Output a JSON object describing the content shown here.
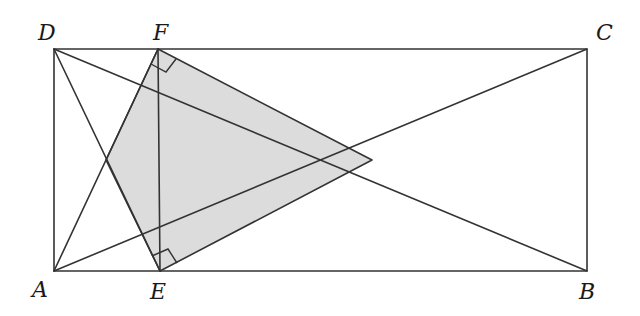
{
  "figure": {
    "colors": {
      "line": "#333333",
      "shade": "#dcdcdc",
      "label": "#1a1a1a",
      "background": "#ffffff"
    },
    "points": {
      "A": {
        "label": "A",
        "x": 54,
        "y": 271
      },
      "B": {
        "label": "B",
        "x": 587,
        "y": 271
      },
      "C": {
        "label": "C",
        "x": 587,
        "y": 49
      },
      "D": {
        "label": "D",
        "x": 54,
        "y": 49
      },
      "E": {
        "label": "E",
        "x": 160,
        "y": 271
      },
      "F": {
        "label": "F",
        "x": 158,
        "y": 49
      }
    },
    "labels": [
      {
        "id": "A",
        "text": "A",
        "x": 32,
        "y": 297
      },
      {
        "id": "B",
        "text": "B",
        "x": 579,
        "y": 299
      },
      {
        "id": "C",
        "text": "C",
        "x": 596,
        "y": 40
      },
      {
        "id": "D",
        "text": "D",
        "x": 38,
        "y": 40
      },
      {
        "id": "E",
        "text": "E",
        "x": 150,
        "y": 299
      },
      {
        "id": "F",
        "text": "F",
        "x": 153,
        "y": 40
      }
    ],
    "segments": [
      "AB",
      "BC",
      "CD",
      "DA",
      "AC",
      "BD",
      "AF",
      "DE",
      "EF"
    ],
    "shaded_region": {
      "description": "Quadrilateral formed by E, F and the intersection of diagonals",
      "vertices": [
        "E",
        "F",
        "G(diagonal intersection)"
      ]
    },
    "right_angles": [
      {
        "at": "F",
        "between": [
          "FE",
          "FC-diagonal"
        ]
      },
      {
        "at": "E",
        "between": [
          "EF",
          "EB-diagonal"
        ]
      }
    ]
  }
}
